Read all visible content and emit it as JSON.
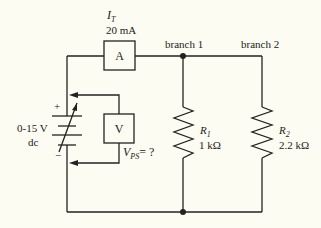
{
  "diagram": {
    "type": "circuit-schematic",
    "colors": {
      "background": "#fdfcf2",
      "ink": "#222222"
    },
    "ammeter": {
      "symbol": "A",
      "current_label": "I",
      "current_sub": "T",
      "reading": "20 mA"
    },
    "voltmeter": {
      "symbol": "V",
      "voltage_label": "V",
      "voltage_sub": "PS",
      "reading": "= ?"
    },
    "power_supply": {
      "range": "0-15 V",
      "type": "dc",
      "plus": "+",
      "minus": "−"
    },
    "branches": [
      {
        "label": "branch 1",
        "resistor_name": "R",
        "resistor_sub": "1",
        "resistance": "1 kΩ"
      },
      {
        "label": "branch 2",
        "resistor_name": "R",
        "resistor_sub": "2",
        "resistance": "2.2 kΩ"
      }
    ]
  }
}
